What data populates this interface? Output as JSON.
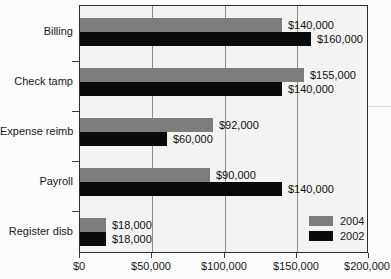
{
  "chart_data": {
    "type": "bar",
    "orientation": "horizontal",
    "title": "",
    "xlabel": "",
    "ylabel": "",
    "categories": [
      "Billing",
      "Check tamp",
      "Expense reimb",
      "Payroll",
      "Register disb"
    ],
    "series": [
      {
        "name": "2004",
        "color": "#7d7d7d",
        "values": [
          140000,
          155000,
          92000,
          90000,
          18000
        ],
        "labels": [
          "$140,000",
          "$155,000",
          "$92,000",
          "$90,000",
          "$18,000"
        ]
      },
      {
        "name": "2002",
        "color": "#0a0a0a",
        "values": [
          160000,
          140000,
          60000,
          140000,
          18000
        ],
        "labels": [
          "$160,000",
          "$140,000",
          "$60,000",
          "$140,000",
          "$18,000"
        ]
      }
    ],
    "xlim": [
      0,
      200000
    ],
    "x_ticks": [
      0,
      50000,
      100000,
      150000,
      200000
    ],
    "x_tick_labels": [
      "$0",
      "$50,000",
      "$100,000",
      "$150,000",
      "$200,000"
    ],
    "gridlines": [
      50000,
      100000,
      150000
    ],
    "grid": "vertical",
    "legend_position": "inside-bottom-right",
    "plot_background": "#f3f3f3"
  }
}
